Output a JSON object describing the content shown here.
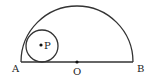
{
  "diagram": {
    "type": "geometry",
    "points": {
      "A": {
        "label": "A",
        "x": 21,
        "y": 62
      },
      "B": {
        "label": "B",
        "x": 133,
        "y": 62
      },
      "O": {
        "label": "O",
        "x": 77,
        "y": 62
      },
      "P": {
        "label": "P",
        "x": 42,
        "y": 45
      }
    },
    "semicircle": {
      "cx": 77,
      "cy": 62,
      "r": 56
    },
    "small_circle": {
      "cx": 42,
      "cy": 46,
      "r": 16
    },
    "stroke_color": "#333333"
  }
}
